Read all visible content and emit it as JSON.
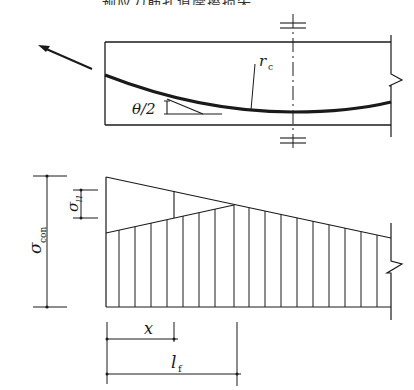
{
  "header": {
    "cropped_caption": "……预应力筋孔道摩擦损失……"
  },
  "top_view": {
    "curve_label": "r",
    "curve_label_sub": "c",
    "angle_label": "θ/2",
    "arrow": "tension-direction-arrow"
  },
  "stress_diagram": {
    "sigma_con_label": "σ",
    "sigma_con_sub": "con",
    "sigma_l1_label": "σ",
    "sigma_l1_sub": "l1",
    "hatch_count": 17
  },
  "dimensions": {
    "x_label": "x",
    "lf_label": "l",
    "lf_sub": "f"
  },
  "colors": {
    "ink": "#1a1a1a",
    "background": "#ffffff"
  }
}
